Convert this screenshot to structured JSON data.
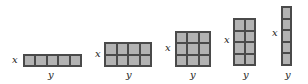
{
  "diagram": {
    "labels": {
      "rows": "x",
      "cols": "y"
    },
    "colors": {
      "fill": "#b3b3b3",
      "border": "#4a4a4a"
    },
    "rectangles": [
      {
        "cols": 5,
        "rows": 1,
        "left": 23,
        "top": 54,
        "width": 59,
        "height": 13,
        "x_label": {
          "left": 12,
          "top": 55
        },
        "y_label": {
          "left": 48,
          "top": 70
        }
      },
      {
        "cols": 4,
        "rows": 2,
        "left": 104,
        "top": 42,
        "width": 48,
        "height": 25,
        "x_label": {
          "left": 95,
          "top": 49
        },
        "y_label": {
          "left": 126,
          "top": 70
        }
      },
      {
        "cols": 3,
        "rows": 3,
        "left": 175,
        "top": 31,
        "width": 36,
        "height": 36,
        "x_label": {
          "left": 165,
          "top": 43
        },
        "y_label": {
          "left": 190,
          "top": 70
        }
      },
      {
        "cols": 2,
        "rows": 4,
        "left": 233,
        "top": 18,
        "width": 23,
        "height": 48,
        "x_label": {
          "left": 224,
          "top": 35
        },
        "y_label": {
          "left": 243,
          "top": 70
        }
      },
      {
        "cols": 1,
        "rows": 5,
        "left": 281,
        "top": 6,
        "width": 11,
        "height": 60,
        "x_label": {
          "left": 272,
          "top": 28
        },
        "y_label": {
          "left": 285,
          "top": 70
        }
      }
    ]
  }
}
